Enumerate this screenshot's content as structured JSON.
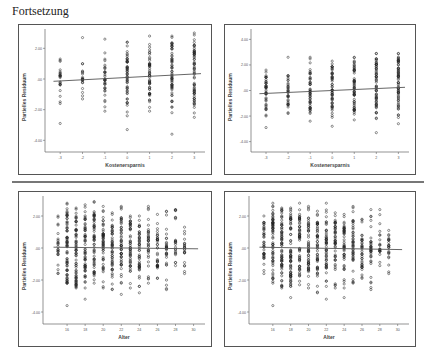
{
  "page": {
    "heading": "Fortsetzung"
  },
  "chart_data": [
    {
      "type": "scatter",
      "panel": "top-left",
      "title": "",
      "xlabel": "Kostenersparnis",
      "ylabel": "Partielles Residuum",
      "x_ticks": [
        "-3",
        "-2",
        "-1",
        "0",
        "1",
        "2",
        "3"
      ],
      "y_ticks": [
        "2.00",
        ".00",
        "-2.00",
        "-4.00"
      ],
      "ylim": [
        -4.5,
        3.0
      ],
      "fit_line": {
        "x": [
          -3.3,
          3.3
        ],
        "y": [
          -0.15,
          0.35
        ]
      },
      "columns": [
        {
          "x": -3,
          "ymin": -1.6,
          "ymax": 1.3,
          "dense_min": -0.6,
          "dense_max": 0.6,
          "outliers": [
            -2.9
          ]
        },
        {
          "x": -2,
          "ymin": -1.3,
          "ymax": 1.0,
          "dense_min": -0.4,
          "dense_max": 0.6,
          "outliers": [
            2.7
          ]
        },
        {
          "x": -1,
          "ymin": -2.1,
          "ymax": 1.7,
          "dense_min": -0.8,
          "dense_max": 1.0,
          "outliers": [
            2.6
          ]
        },
        {
          "x": 0,
          "ymin": -2.4,
          "ymax": 2.4,
          "dense_min": -1.6,
          "dense_max": 1.8,
          "outliers": [
            -3.3
          ]
        },
        {
          "x": 1,
          "ymin": -2.1,
          "ymax": 2.8,
          "dense_min": -1.4,
          "dense_max": 2.0,
          "outliers": []
        },
        {
          "x": 2,
          "ymin": -2.2,
          "ymax": 2.8,
          "dense_min": -1.6,
          "dense_max": 2.4,
          "outliers": [
            -3.6
          ]
        },
        {
          "x": 3,
          "ymin": -2.5,
          "ymax": 3.0,
          "dense_min": -1.8,
          "dense_max": 2.6,
          "outliers": []
        }
      ]
    },
    {
      "type": "scatter",
      "panel": "top-right",
      "title": "",
      "xlabel": "Kostenersparnis",
      "ylabel": "Partielles Residuum",
      "x_ticks": [
        "-3",
        "-2",
        "-1",
        "0",
        "1",
        "2",
        "3"
      ],
      "y_ticks": [
        "4.00",
        "2.00",
        ".00",
        "-2.00",
        "-4.00"
      ],
      "ylim": [
        -4.5,
        4.5
      ],
      "fit_line": {
        "x": [
          -3.3,
          3.3
        ],
        "y": [
          -0.25,
          0.25
        ]
      },
      "columns": [
        {
          "x": -3,
          "ymin": -2.0,
          "ymax": 1.6,
          "dense_min": -1.5,
          "dense_max": 1.1,
          "outliers": [
            -2.9
          ]
        },
        {
          "x": -2,
          "ymin": -1.8,
          "ymax": 2.6,
          "dense_min": -1.2,
          "dense_max": 0.6,
          "outliers": []
        },
        {
          "x": -1,
          "ymin": -2.4,
          "ymax": 2.6,
          "dense_min": -1.6,
          "dense_max": 1.6,
          "outliers": []
        },
        {
          "x": 0,
          "ymin": -2.1,
          "ymax": 2.3,
          "dense_min": -1.8,
          "dense_max": 2.0,
          "outliers": [
            -2.8
          ]
        },
        {
          "x": 1,
          "ymin": -2.3,
          "ymax": 2.6,
          "dense_min": -1.6,
          "dense_max": 2.4,
          "outliers": []
        },
        {
          "x": 2,
          "ymin": -2.2,
          "ymax": 2.9,
          "dense_min": -1.8,
          "dense_max": 2.5,
          "outliers": [
            -3.3
          ]
        },
        {
          "x": 3,
          "ymin": -2.6,
          "ymax": 2.9,
          "dense_min": -1.7,
          "dense_max": 2.7,
          "outliers": []
        }
      ]
    },
    {
      "type": "scatter",
      "panel": "bottom-left",
      "title": "",
      "xlabel": "Alter",
      "ylabel": "Partielles Residuum",
      "x_ticks": [
        "16",
        "18",
        "20",
        "22",
        "24",
        "26",
        "28",
        "30"
      ],
      "y_ticks": [
        "2.00",
        ".00",
        "-2.00",
        "-4.00"
      ],
      "ylim": [
        -4.5,
        3.0
      ],
      "fit_line": {
        "x": [
          14.5,
          30.5
        ],
        "y": [
          0.05,
          -0.05
        ]
      },
      "columns": [
        {
          "x": 15,
          "ymin": -1.6,
          "ymax": 2.0,
          "dense_min": -0.5,
          "dense_max": 0.6,
          "outliers": []
        },
        {
          "x": 16,
          "ymin": -2.2,
          "ymax": 2.8,
          "dense_min": -2.2,
          "dense_max": 2.6,
          "outliers": [
            -3.6
          ]
        },
        {
          "x": 17,
          "ymin": -2.5,
          "ymax": 2.5,
          "dense_min": -2.4,
          "dense_max": 2.4,
          "outliers": []
        },
        {
          "x": 18,
          "ymin": -2.5,
          "ymax": 2.7,
          "dense_min": -1.9,
          "dense_max": 2.1,
          "outliers": [
            -3.2
          ]
        },
        {
          "x": 19,
          "ymin": -2.2,
          "ymax": 2.9,
          "dense_min": -1.8,
          "dense_max": 2.2,
          "outliers": []
        },
        {
          "x": 20,
          "ymin": -2.5,
          "ymax": 2.6,
          "dense_min": -1.4,
          "dense_max": 2.0,
          "outliers": []
        },
        {
          "x": 21,
          "ymin": -2.6,
          "ymax": 2.2,
          "dense_min": -1.7,
          "dense_max": 1.6,
          "outliers": []
        },
        {
          "x": 22,
          "ymin": -2.2,
          "ymax": 2.6,
          "dense_min": -1.3,
          "dense_max": 2.0,
          "outliers": [
            -2.9
          ]
        },
        {
          "x": 23,
          "ymin": -2.5,
          "ymax": 2.0,
          "dense_min": -1.4,
          "dense_max": 1.8,
          "outliers": []
        },
        {
          "x": 24,
          "ymin": -2.4,
          "ymax": 2.0,
          "dense_min": -1.4,
          "dense_max": 1.6,
          "outliers": [
            -2.8
          ]
        },
        {
          "x": 25,
          "ymin": -2.2,
          "ymax": 2.6,
          "dense_min": -0.6,
          "dense_max": 1.1,
          "outliers": []
        },
        {
          "x": 26,
          "ymin": -1.9,
          "ymax": 2.1,
          "dense_min": -1.2,
          "dense_max": 1.0,
          "outliers": []
        },
        {
          "x": 27,
          "ymin": -2.6,
          "ymax": 2.3,
          "dense_min": -0.6,
          "dense_max": 0.8,
          "outliers": []
        },
        {
          "x": 28,
          "ymin": -1.1,
          "ymax": 2.4,
          "dense_min": -0.5,
          "dense_max": 0.5,
          "outliers": []
        },
        {
          "x": 29,
          "ymin": -1.6,
          "ymax": 1.3,
          "dense_min": -0.4,
          "dense_max": 0.6,
          "outliers": []
        }
      ]
    },
    {
      "type": "scatter",
      "panel": "bottom-right",
      "title": "",
      "xlabel": "Alter",
      "ylabel": "Partielles Residuum",
      "x_ticks": [
        "16",
        "18",
        "20",
        "22",
        "24",
        "26",
        "28",
        "30"
      ],
      "y_ticks": [
        "2.00",
        ".00",
        "-2.00",
        "-4.00"
      ],
      "ylim": [
        -4.5,
        3.0
      ],
      "fit_line": {
        "x": [
          14.5,
          30.5
        ],
        "y": [
          0.05,
          -0.1
        ]
      },
      "columns": [
        {
          "x": 15,
          "ymin": -1.6,
          "ymax": 2.0,
          "dense_min": -0.8,
          "dense_max": 1.6,
          "outliers": []
        },
        {
          "x": 16,
          "ymin": -2.2,
          "ymax": 2.8,
          "dense_min": -2.0,
          "dense_max": 2.6,
          "outliers": [
            -3.6
          ]
        },
        {
          "x": 17,
          "ymin": -2.5,
          "ymax": 2.5,
          "dense_min": -2.4,
          "dense_max": 2.4,
          "outliers": []
        },
        {
          "x": 18,
          "ymin": -2.4,
          "ymax": 2.5,
          "dense_min": -2.3,
          "dense_max": 2.4,
          "outliers": [
            -3.1
          ]
        },
        {
          "x": 19,
          "ymin": -2.3,
          "ymax": 2.8,
          "dense_min": -1.8,
          "dense_max": 2.0,
          "outliers": []
        },
        {
          "x": 20,
          "ymin": -2.5,
          "ymax": 2.6,
          "dense_min": -1.4,
          "dense_max": 2.0,
          "outliers": []
        },
        {
          "x": 21,
          "ymin": -2.8,
          "ymax": 2.3,
          "dense_min": -1.7,
          "dense_max": 1.7,
          "outliers": []
        },
        {
          "x": 22,
          "ymin": -2.4,
          "ymax": 2.8,
          "dense_min": -1.3,
          "dense_max": 2.0,
          "outliers": [
            -3.2
          ]
        },
        {
          "x": 23,
          "ymin": -2.5,
          "ymax": 2.2,
          "dense_min": -1.4,
          "dense_max": 1.8,
          "outliers": []
        },
        {
          "x": 24,
          "ymin": -2.5,
          "ymax": 2.1,
          "dense_min": -1.4,
          "dense_max": 1.6,
          "outliers": [
            -3.1
          ]
        },
        {
          "x": 25,
          "ymin": -2.2,
          "ymax": 2.6,
          "dense_min": -1.0,
          "dense_max": 1.7,
          "outliers": []
        },
        {
          "x": 26,
          "ymin": -1.9,
          "ymax": 1.8,
          "dense_min": -1.4,
          "dense_max": 0.8,
          "outliers": []
        },
        {
          "x": 27,
          "ymin": -2.6,
          "ymax": 2.4,
          "dense_min": -1.2,
          "dense_max": 0.6,
          "outliers": []
        },
        {
          "x": 28,
          "ymin": -1.1,
          "ymax": 2.4,
          "dense_min": -0.3,
          "dense_max": 0.6,
          "outliers": []
        },
        {
          "x": 29,
          "ymin": -1.6,
          "ymax": 1.1,
          "dense_min": -0.4,
          "dense_max": 0.8,
          "outliers": []
        }
      ]
    }
  ],
  "style": {
    "point_color": "#222222",
    "line_color": "#555555",
    "frame_color": "#555555",
    "axis_color": "#666666",
    "tick_label_color": "#555555"
  }
}
